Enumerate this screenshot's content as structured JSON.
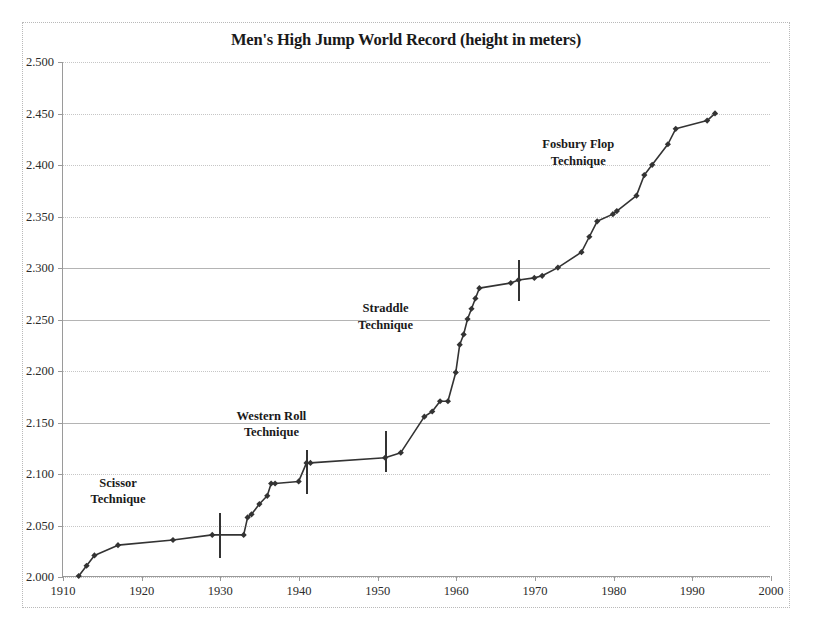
{
  "chart_data": {
    "type": "line",
    "title": "Men's High Jump World Record (height in meters)",
    "xlabel": "",
    "ylabel": "",
    "xlim": [
      1910,
      2000
    ],
    "ylim": [
      2.0,
      2.5
    ],
    "xticks": [
      1910,
      1920,
      1930,
      1940,
      1950,
      1960,
      1970,
      1980,
      1990,
      2000
    ],
    "yticks": [
      "2.000",
      "2.050",
      "2.100",
      "2.150",
      "2.200",
      "2.250",
      "2.300",
      "2.350",
      "2.400",
      "2.450",
      "2.500"
    ],
    "ytick_values": [
      2.0,
      2.05,
      2.1,
      2.15,
      2.2,
      2.25,
      2.3,
      2.35,
      2.4,
      2.45,
      2.5
    ],
    "grid": true,
    "legend": "none",
    "marker": "diamond",
    "line_color": "#333333",
    "marker_color": "#333333",
    "series": [
      {
        "name": "Men's High Jump World Record",
        "x": [
          1912,
          1914,
          1917,
          1924,
          1930,
          1933,
          1934,
          1936,
          1937,
          1941,
          1953,
          1956,
          1957,
          1960,
          1961,
          1962,
          1963,
          1970,
          1971,
          1973,
          1976,
          1977,
          1978,
          1980,
          1983,
          1985,
          1987,
          1988,
          1993
        ],
        "y": [
          2.0,
          2.02,
          2.03,
          2.035,
          2.04,
          2.06,
          2.07,
          2.09,
          2.095,
          2.11,
          2.12,
          2.16,
          2.17,
          2.23,
          2.26,
          2.28,
          2.285,
          2.295,
          2.3,
          2.315,
          2.33,
          2.345,
          2.36,
          2.37,
          2.39,
          2.4,
          2.42,
          2.435,
          2.45
        ],
        "points": [
          {
            "x": 1912,
            "y": 2.0
          },
          {
            "x": 1913,
            "y": 2.01
          },
          {
            "x": 1914,
            "y": 2.02
          },
          {
            "x": 1917,
            "y": 2.03
          },
          {
            "x": 1924,
            "y": 2.035
          },
          {
            "x": 1929,
            "y": 2.04
          },
          {
            "x": 1933,
            "y": 2.04
          },
          {
            "x": 1933.5,
            "y": 2.057
          },
          {
            "x": 1934,
            "y": 2.06
          },
          {
            "x": 1935,
            "y": 2.07
          },
          {
            "x": 1936,
            "y": 2.078
          },
          {
            "x": 1936.5,
            "y": 2.09
          },
          {
            "x": 1937,
            "y": 2.09
          },
          {
            "x": 1940,
            "y": 2.092
          },
          {
            "x": 1941,
            "y": 2.11
          },
          {
            "x": 1941.5,
            "y": 2.11
          },
          {
            "x": 1951,
            "y": 2.115
          },
          {
            "x": 1953,
            "y": 2.12
          },
          {
            "x": 1956,
            "y": 2.155
          },
          {
            "x": 1957,
            "y": 2.16
          },
          {
            "x": 1958,
            "y": 2.17
          },
          {
            "x": 1959,
            "y": 2.17
          },
          {
            "x": 1960,
            "y": 2.198
          },
          {
            "x": 1960.5,
            "y": 2.225
          },
          {
            "x": 1961,
            "y": 2.235
          },
          {
            "x": 1961.5,
            "y": 2.25
          },
          {
            "x": 1962,
            "y": 2.26
          },
          {
            "x": 1962.5,
            "y": 2.27
          },
          {
            "x": 1963,
            "y": 2.28
          },
          {
            "x": 1967,
            "y": 2.285
          },
          {
            "x": 1968,
            "y": 2.288
          },
          {
            "x": 1970,
            "y": 2.29
          },
          {
            "x": 1971,
            "y": 2.292
          },
          {
            "x": 1973,
            "y": 2.3
          },
          {
            "x": 1976,
            "y": 2.315
          },
          {
            "x": 1977,
            "y": 2.33
          },
          {
            "x": 1978,
            "y": 2.345
          },
          {
            "x": 1980,
            "y": 2.352
          },
          {
            "x": 1980.5,
            "y": 2.355
          },
          {
            "x": 1983,
            "y": 2.37
          },
          {
            "x": 1984,
            "y": 2.39
          },
          {
            "x": 1985,
            "y": 2.4
          },
          {
            "x": 1987,
            "y": 2.42
          },
          {
            "x": 1988,
            "y": 2.435
          },
          {
            "x": 1992,
            "y": 2.443
          },
          {
            "x": 1993,
            "y": 2.45
          }
        ]
      }
    ],
    "annotations": [
      {
        "label_line1": "Scissor",
        "label_line2": "Technique",
        "x": 1917.0,
        "y": 2.083
      },
      {
        "label_line1": "Western Roll",
        "label_line2": "Technique",
        "x": 1936.5,
        "y": 2.148
      },
      {
        "label_line1": "Straddle",
        "label_line2": "Technique",
        "x": 1951.0,
        "y": 2.252
      },
      {
        "label_line1": "Fosbury Flop",
        "label_line2": "Technique",
        "x": 1975.5,
        "y": 2.412
      }
    ],
    "era_dividers": [
      {
        "x": 1930,
        "y_center": 2.04,
        "half_height": 0.022
      },
      {
        "x": 1941,
        "y_center": 2.102,
        "half_height": 0.021
      },
      {
        "x": 1951,
        "y_center": 2.122,
        "half_height": 0.02
      },
      {
        "x": 1968,
        "y_center": 2.288,
        "half_height": 0.02
      }
    ]
  }
}
